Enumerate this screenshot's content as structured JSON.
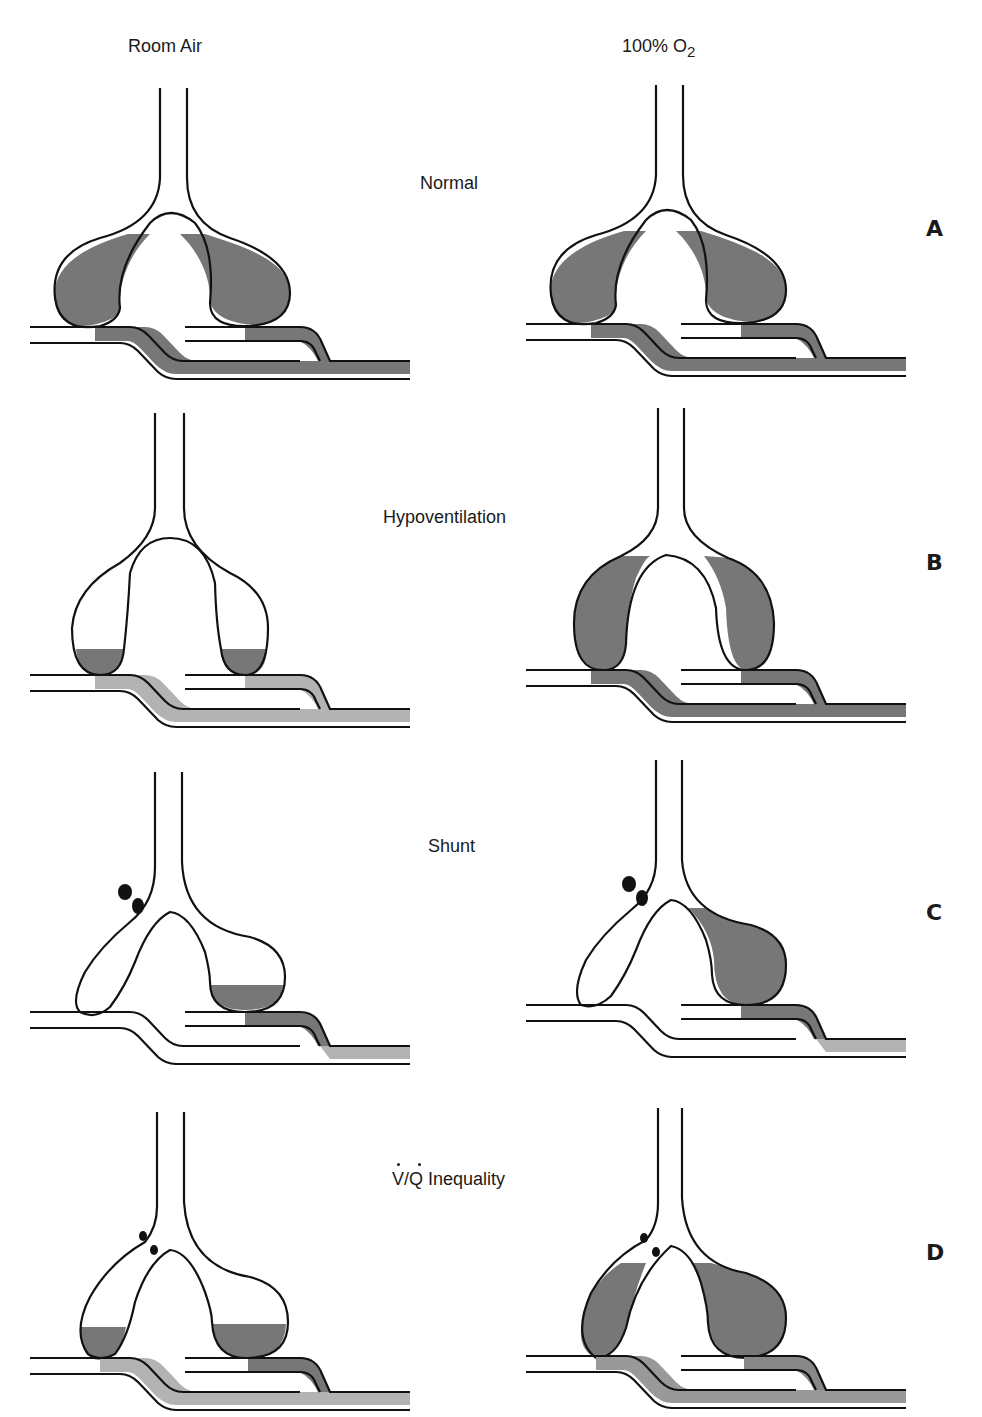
{
  "columns": {
    "left": "Room Air",
    "right_prefix": "100% O",
    "right_subscript": "2"
  },
  "rows": [
    {
      "letter": "A",
      "label": "Normal"
    },
    {
      "letter": "B",
      "label": "Hypoventilation"
    },
    {
      "letter": "C",
      "label": "Shunt"
    },
    {
      "letter": "D",
      "label": "V/Q Inequality"
    }
  ],
  "colors": {
    "dark_gray": "#777777",
    "light_gray": "#b3b3b3",
    "stroke": "#111111",
    "background": "#ffffff"
  }
}
